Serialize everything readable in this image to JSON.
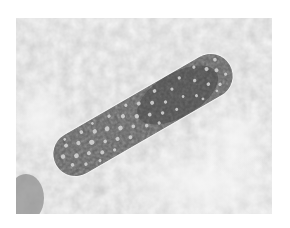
{
  "image": {
    "kind": "grayscale light micrograph",
    "subject": "elongated cylindrical cell with granular vacuolated cytoplasm",
    "background_color": "#ffffff",
    "frame": {
      "x": 16,
      "y": 18,
      "width": 256,
      "height": 196
    },
    "colors": {
      "field_light": "#eaeaea",
      "field_mid": "#c9c9c9",
      "cell_dark": "#4a4a4a",
      "cell_mid": "#6e6e6e",
      "vacuole": "#d8d8d8",
      "membrane": "#f4f4f4"
    }
  }
}
